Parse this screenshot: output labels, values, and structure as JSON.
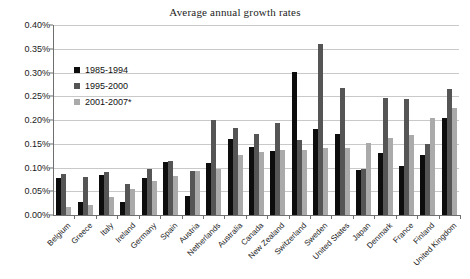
{
  "chart_data": {
    "type": "bar",
    "title": "Average annual growth rates",
    "xlabel": "",
    "ylabel": "",
    "ylim": [
      0.0,
      0.4
    ],
    "ytick_labels": [
      "0.40%",
      "0.35%",
      "0.30%",
      "0.25%",
      "0.20%",
      "0.15%",
      "0.10%",
      "0.05%",
      "0.00%"
    ],
    "ytick_values": [
      0.4,
      0.35,
      0.3,
      0.25,
      0.2,
      0.15,
      0.1,
      0.05,
      0.0
    ],
    "grid": true,
    "legend_position": "inside-upper-left",
    "value_unit": "percent",
    "categories": [
      "Belgium",
      "Greece",
      "Italy",
      "Ireland",
      "Germany",
      "Spain",
      "Austria",
      "Netherlands",
      "Australia",
      "Canada",
      "New Zealand",
      "Switzerland",
      "Sweden",
      "United States",
      "Japan",
      "Denmark",
      "France",
      "Finland",
      "United Kingdom"
    ],
    "series": [
      {
        "name": "1985-1994",
        "color": "#0d0d0d",
        "values": [
          0.078,
          0.027,
          0.084,
          0.028,
          0.077,
          0.112,
          0.039,
          0.11,
          0.159,
          0.143,
          0.135,
          0.301,
          0.181,
          0.17,
          0.095,
          0.131,
          0.104,
          0.126,
          0.204
        ]
      },
      {
        "name": "1995-2000",
        "color": "#555555",
        "values": [
          0.087,
          0.081,
          0.09,
          0.066,
          0.096,
          0.113,
          0.093,
          0.199,
          0.183,
          0.17,
          0.193,
          0.157,
          0.36,
          0.268,
          0.096,
          0.247,
          0.245,
          0.15,
          0.266
        ]
      },
      {
        "name": "2001-2007*",
        "color": "#aaaaaa",
        "values": [
          0.016,
          0.021,
          0.038,
          0.054,
          0.071,
          0.082,
          0.093,
          0.096,
          0.126,
          0.133,
          0.136,
          0.136,
          0.141,
          0.142,
          0.152,
          0.163,
          0.168,
          0.205,
          0.225
        ]
      }
    ]
  }
}
